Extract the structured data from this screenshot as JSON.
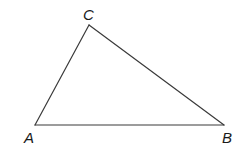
{
  "figure": {
    "type": "triangle",
    "vertices": [
      {
        "id": "A",
        "label": "A"
      },
      {
        "id": "B",
        "label": "B"
      },
      {
        "id": "C",
        "label": "C"
      }
    ],
    "edges": [
      {
        "from": "A",
        "to": "B"
      },
      {
        "from": "B",
        "to": "C"
      },
      {
        "from": "C",
        "to": "A"
      }
    ],
    "colors": {
      "line": "#3a3a3a",
      "label": "#1a1a1a",
      "background": "#ffffff"
    }
  }
}
